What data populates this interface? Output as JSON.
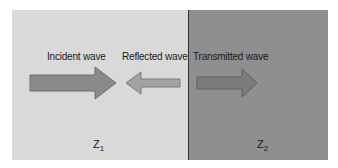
{
  "diagram": {
    "type": "wave-reflection-transmission",
    "media": [
      {
        "id": "medium-1",
        "impedance_symbol": "Z",
        "impedance_subscript": "1",
        "color": "#d9d9d9"
      },
      {
        "id": "medium-2",
        "impedance_symbol": "Z",
        "impedance_subscript": "2",
        "color": "#8f8f8f"
      }
    ],
    "boundary_color": "#333333",
    "arrows": [
      {
        "label": "Incident wave",
        "direction": "right",
        "fill": "#8a8a8a",
        "stroke": "#6e6e6e"
      },
      {
        "label": "Reflected wave",
        "direction": "left",
        "fill": "#a3a3a3",
        "stroke": "#7a7a7a"
      },
      {
        "label": "Transmitted wave",
        "direction": "right",
        "fill": "#7c7c7c",
        "stroke": "#5e5e5e"
      }
    ]
  }
}
